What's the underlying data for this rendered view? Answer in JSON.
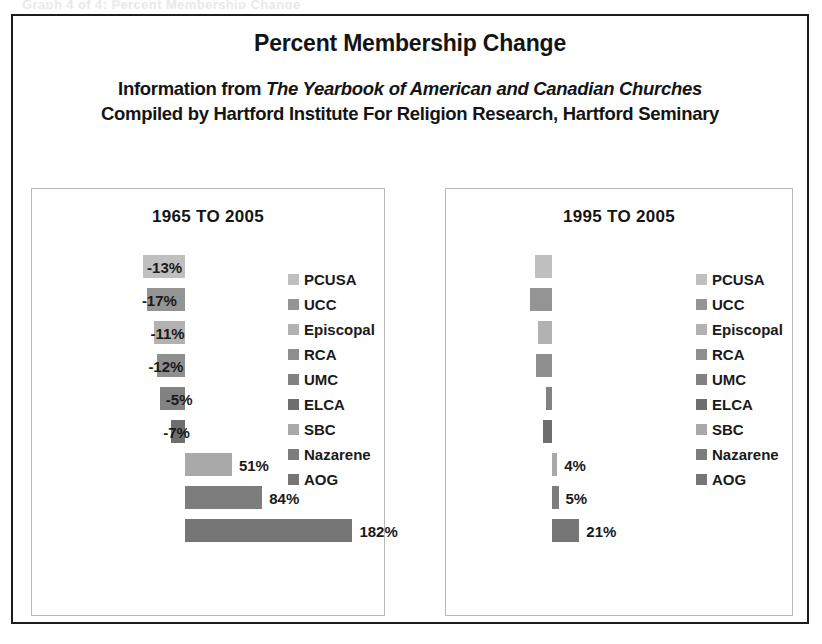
{
  "clipped_top_text": "Graph 4 of 4: Percent Membership Change",
  "header": {
    "main_title": "Percent Membership Change",
    "source_prefix": "Information from ",
    "source_book": "The Yearbook of American and Canadian Churches",
    "source_line_2": "Compiled by Hartford Institute For Religion Research, Hartford Seminary"
  },
  "palette": {
    "PCUSA": "#bfbfbf",
    "UCC": "#949494",
    "Episcopal": "#b2b2b2",
    "RCA": "#8f8f8f",
    "UMC": "#828282",
    "ELCA": "#6e6e6e",
    "SBC": "#a9a9a9",
    "Nazarene": "#7d7d7d",
    "AOG": "#767676"
  },
  "chart_data": [
    {
      "type": "bar",
      "orientation": "horizontal",
      "title": "1965 TO 2005",
      "xlabel": "",
      "ylabel": "",
      "grid": false,
      "legend_position": "right",
      "axis_zero": 0,
      "categories": [
        "PCUSA",
        "UCC",
        "Episcopal",
        "RCA",
        "UMC",
        "ELCA",
        "SBC",
        "Nazarene",
        "AOG"
      ],
      "values": [
        -46,
        -41,
        -34,
        -30,
        -27,
        -15,
        51,
        84,
        182
      ],
      "labels": [
        "-46%",
        "-41%",
        "-34%",
        "-30%",
        "-27%",
        "-15%",
        "51%",
        "84%",
        "182%"
      ],
      "legend": [
        "PCUSA",
        "UCC",
        "Episcopal",
        "RCA",
        "UMC",
        "ELCA",
        "SBC",
        "Nazarene",
        "AOG"
      ]
    },
    {
      "type": "bar",
      "orientation": "horizontal",
      "title": "1995 TO 2005",
      "xlabel": "",
      "ylabel": "",
      "grid": false,
      "legend_position": "right",
      "axis_zero": 0,
      "categories": [
        "PCUSA",
        "UCC",
        "Episcopal",
        "RCA",
        "UMC",
        "ELCA",
        "SBC",
        "Nazarene",
        "AOG"
      ],
      "values": [
        -13,
        -17,
        -11,
        -12,
        -5,
        -7,
        4,
        5,
        21
      ],
      "labels": [
        "-13%",
        "-17%",
        "-11%",
        "-12%",
        "-5%",
        "-7%",
        "4%",
        "5%",
        "21%"
      ],
      "legend": [
        "PCUSA",
        "UCC",
        "Episcopal",
        "RCA",
        "UMC",
        "ELCA",
        "SBC",
        "Nazarene",
        "AOG"
      ]
    }
  ]
}
